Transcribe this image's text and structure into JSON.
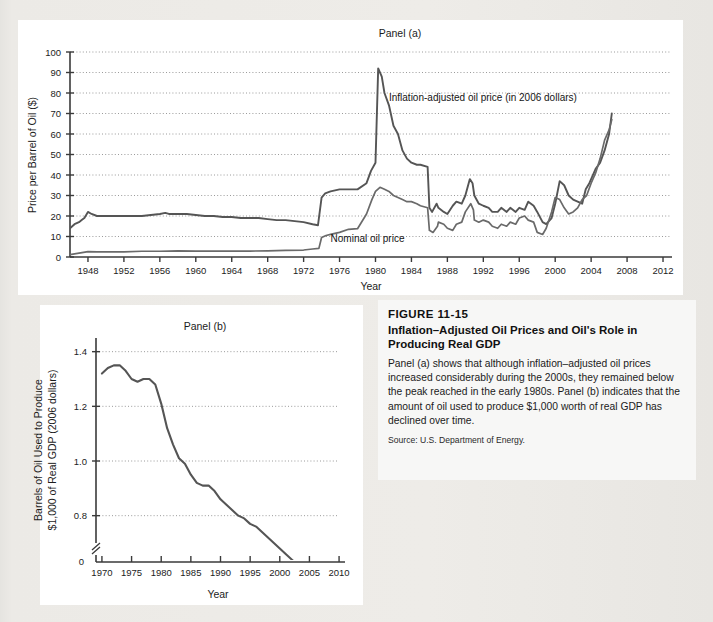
{
  "figure": {
    "number": "FIGURE 11-15",
    "title": "Inflation–Adjusted Oil Prices and Oil's Role in Producing Real GDP",
    "body": "Panel (a) shows that although inflation–adjusted oil prices increased considerably during the 2000s, they remained below the peak reached in the early 1980s. Panel (b) indicates that the amount of oil used to produce $1,000 worth of real GDP has declined over time.",
    "source": "Source: U.S. Department of Energy."
  },
  "colors": {
    "page_bg": "#e9e8e4",
    "panel_bg": "#ffffff",
    "line": "#4a4a4a",
    "axis": "#3a3a3a",
    "grid": "#9a9a9a",
    "text": "#1a1a1a"
  },
  "chart_data": [
    {
      "type": "line",
      "panel": "Panel (a)",
      "title": "Panel (a)",
      "xlabel": "Year",
      "ylabel": "Price per Barrel of Oil ($)",
      "xlim": [
        1946,
        2013
      ],
      "ylim": [
        0,
        100
      ],
      "xticks": [
        1948,
        1952,
        1956,
        1960,
        1964,
        1968,
        1972,
        1976,
        1980,
        1984,
        1988,
        1992,
        1996,
        2000,
        2004,
        2008,
        2012
      ],
      "yticks": [
        0,
        10,
        20,
        30,
        40,
        50,
        60,
        70,
        80,
        90,
        100
      ],
      "grid": true,
      "legend": "none",
      "annotations": [
        {
          "text": "Inflation-adjusted oil price (in 2006 dollars)",
          "x": 1981.5,
          "y": 76
        },
        {
          "text": "Nominal oil price",
          "x": 1975.0,
          "y": 7.5
        }
      ],
      "series": [
        {
          "name": "Inflation-adjusted oil price (in 2006 dollars)",
          "x": [
            1946,
            1946.5,
            1947,
            1947.3,
            1947.6,
            1948,
            1948.4,
            1949,
            1949.5,
            1950,
            1951,
            1952,
            1953,
            1954,
            1955,
            1956,
            1956.6,
            1957,
            1957.5,
            1958,
            1959,
            1960,
            1961,
            1962,
            1963,
            1964,
            1965,
            1966,
            1967,
            1968,
            1969,
            1970,
            1971,
            1972,
            1973,
            1973.6,
            1974,
            1974.4,
            1975,
            1976,
            1977,
            1978,
            1979,
            1979.5,
            1980,
            1980.3,
            1980.7,
            1981,
            1981.5,
            1982,
            1982.5,
            1983,
            1983.5,
            1984,
            1984.6,
            1985,
            1985.8,
            1986,
            1986.3,
            1986.8,
            1987,
            1987.6,
            1988,
            1988.6,
            1989,
            1989.6,
            1990,
            1990.5,
            1990.8,
            1991,
            1991.5,
            1992,
            1992.6,
            1993,
            1993.6,
            1994,
            1994.6,
            1995,
            1995.6,
            1996,
            1996.6,
            1997,
            1997.6,
            1998,
            1998.6,
            1999,
            1999.6,
            2000,
            2000.5,
            2001,
            2001.5,
            2002,
            2002.5,
            2003,
            2003.4,
            2003.8,
            2004,
            2004.5,
            2005,
            2005.5,
            2006,
            2006.3
          ],
          "y": [
            14,
            16,
            17,
            18,
            19,
            22,
            21,
            20,
            20,
            20,
            20,
            20,
            20,
            20,
            20.5,
            21,
            21.5,
            21,
            21,
            21,
            21,
            20.5,
            20,
            20,
            19.5,
            19.5,
            19,
            19,
            19,
            18.5,
            18,
            18,
            17.5,
            17,
            16,
            15.5,
            29,
            31,
            32,
            33,
            33,
            33,
            36,
            42,
            46,
            92,
            88,
            80,
            74,
            64,
            60,
            52,
            48,
            46,
            45,
            45,
            44,
            24,
            22,
            26,
            24,
            22,
            21,
            25,
            27,
            26,
            30,
            38,
            36,
            30,
            26,
            25,
            24,
            22,
            22,
            24,
            22,
            24,
            22,
            24,
            23,
            27,
            25,
            22,
            17,
            16,
            19,
            26,
            37,
            35,
            30,
            28,
            27,
            26,
            33,
            36,
            38,
            43,
            46,
            52,
            60,
            70,
            73
          ]
        },
        {
          "name": "Nominal oil price",
          "x": [
            1946,
            1947,
            1948,
            1949,
            1950,
            1952,
            1954,
            1956,
            1958,
            1960,
            1962,
            1964,
            1966,
            1968,
            1970,
            1972,
            1973,
            1973.7,
            1974,
            1974.5,
            1975,
            1976,
            1977,
            1978,
            1979,
            1979.6,
            1980,
            1980.5,
            1981,
            1981.5,
            1982,
            1983,
            1983.5,
            1984,
            1984.6,
            1985,
            1985.8,
            1986,
            1986.4,
            1986.9,
            1987,
            1987.6,
            1988,
            1988.6,
            1989,
            1989.6,
            1990,
            1990.6,
            1990.9,
            1991,
            1991.5,
            1992,
            1992.6,
            1993,
            1993.6,
            1994,
            1994.6,
            1995,
            1995.6,
            1996,
            1996.6,
            1997,
            1997.6,
            1998,
            1998.6,
            1999,
            1999.6,
            2000,
            2000.5,
            2001,
            2001.5,
            2002,
            2002.5,
            2003,
            2003.5,
            2004,
            2004.5,
            2005,
            2005.5,
            2006,
            2006.3
          ],
          "y": [
            1.2,
            1.9,
            2.6,
            2.5,
            2.5,
            2.5,
            2.8,
            2.8,
            3.0,
            2.9,
            2.9,
            2.9,
            2.9,
            3.0,
            3.2,
            3.4,
            3.9,
            4.2,
            9.5,
            10.5,
            11.0,
            12.0,
            13.5,
            13.8,
            21,
            28,
            32,
            34,
            33,
            32,
            30,
            28,
            27,
            27,
            26,
            25,
            24,
            13,
            12,
            15,
            17,
            16,
            14,
            13,
            16,
            17,
            22,
            26,
            23,
            18,
            17,
            18,
            17,
            15,
            14,
            16,
            15,
            17,
            16,
            19,
            20,
            18,
            17,
            12,
            11,
            14,
            22,
            29,
            28,
            24,
            21,
            22,
            24,
            28,
            30,
            36,
            41,
            48,
            57,
            62,
            67
          ]
        }
      ]
    },
    {
      "type": "line",
      "panel": "Panel (b)",
      "title": "Panel (b)",
      "xlabel": "Year",
      "ylabel": "Barrels of Oil Used to Produce $1,000 of Real GDP (2006 dollars)",
      "xlim": [
        1969,
        2011
      ],
      "ylim": [
        0.7,
        1.45
      ],
      "xticks": [
        1970,
        1975,
        1980,
        1985,
        1990,
        1995,
        2000,
        2005,
        2010
      ],
      "yticks": [
        0.8,
        1.0,
        1.2,
        1.4
      ],
      "ytick_labels": [
        "0.8",
        "1.0",
        "1.2",
        "1.4"
      ],
      "axis_break": true,
      "zero_label": "0",
      "grid": true,
      "legend": "none",
      "series": [
        {
          "name": "Barrels of oil per $1,000 real GDP",
          "x": [
            1970,
            1971,
            1972,
            1973,
            1974,
            1975,
            1976,
            1977,
            1978,
            1979,
            1980,
            1981,
            1982,
            1983,
            1984,
            1985,
            1986,
            1987,
            1988,
            1989,
            1990,
            1991,
            1992,
            1993,
            1994,
            1995,
            1996,
            1997,
            1998,
            1999,
            2000,
            2001,
            2002,
            2003,
            2004,
            2005,
            2006
          ],
          "y": [
            1.32,
            1.34,
            1.35,
            1.35,
            1.33,
            1.3,
            1.29,
            1.3,
            1.3,
            1.28,
            1.21,
            1.12,
            1.06,
            1.01,
            0.99,
            0.95,
            0.92,
            0.91,
            0.91,
            0.89,
            0.86,
            0.84,
            0.82,
            0.8,
            0.79,
            0.77,
            0.76,
            0.74,
            0.72,
            0.7,
            0.68,
            0.66,
            0.64,
            0.62,
            0.61,
            0.59,
            0.57
          ]
        }
      ]
    }
  ]
}
